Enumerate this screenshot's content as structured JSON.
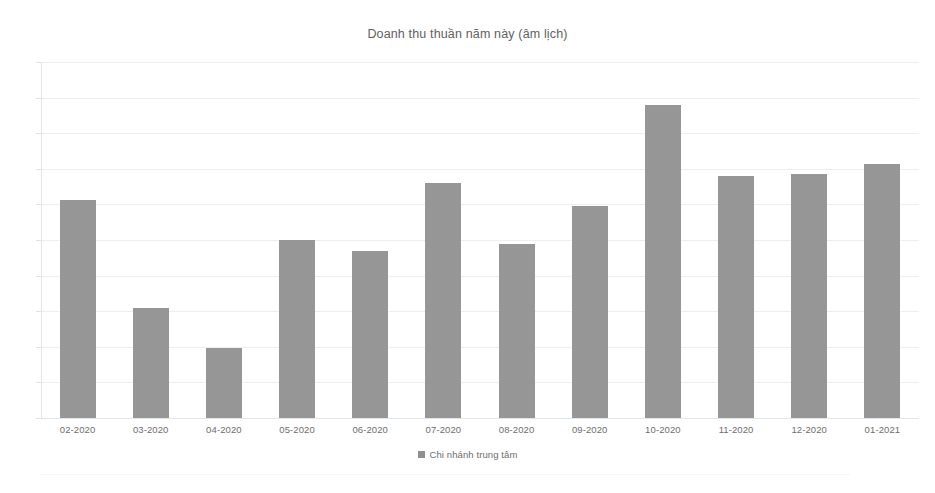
{
  "chart_data": {
    "type": "bar",
    "title": "Doanh thu thuần năm này (âm lịch)",
    "subtitle": "",
    "xlabel": "",
    "ylabel": "",
    "categories": [
      "02-2020",
      "03-2020",
      "04-2020",
      "05-2020",
      "06-2020",
      "07-2020",
      "08-2020",
      "09-2020",
      "10-2020",
      "11-2020",
      "12-2020",
      "01-2021"
    ],
    "series": [
      {
        "name": "Chi nhánh trung tâm",
        "color": "#969696",
        "values": [
          6.42,
          3.24,
          2.06,
          5.24,
          4.91,
          6.91,
          5.12,
          6.24,
          9.21,
          7.12,
          7.18,
          7.47
        ]
      }
    ],
    "ylim": [
      0,
      10.47
    ],
    "y_tick_labels": [],
    "y_axis_labels_visible": false,
    "gridlines": 11,
    "grid": true,
    "legend_position": "bottom",
    "bar_color": "#969696",
    "gridline_color": "#eceff1",
    "axis_color": "#e3e6e8",
    "text_color": "#6d6d6d",
    "title_color": "#60605f",
    "background": "#ffffff"
  },
  "legend": {
    "entries": [
      {
        "label": "Chi nhánh trung tâm",
        "color": "#8e8e8e"
      }
    ]
  },
  "axis": {
    "x_tick_labels": [
      "02-2020",
      "03-2020",
      "04-2020",
      "05-2020",
      "06-2020",
      "07-2020",
      "08-2020",
      "09-2020",
      "10-2020",
      "11-2020",
      "12-2020",
      "01-2021"
    ]
  }
}
